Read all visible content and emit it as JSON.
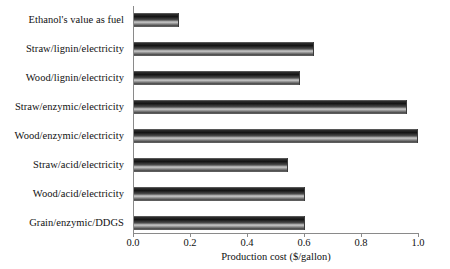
{
  "chart_data": {
    "type": "bar",
    "orientation": "horizontal",
    "title": "",
    "xlabel": "Production cost ($/gallon)",
    "ylabel": "",
    "xlim": [
      0.0,
      1.0
    ],
    "xticks": [
      "0.0",
      "0.2",
      "0.4",
      "0.6",
      "0.8",
      "1.0"
    ],
    "xtick_values": [
      0.0,
      0.2,
      0.4,
      0.6,
      0.8,
      1.0
    ],
    "grid": false,
    "legend": null,
    "categories": [
      "Ethanol's value as fuel",
      "Straw/lignin/electricity",
      "Wood/lignin/electricity",
      "Straw/enzymic/electricity",
      "Wood/enzymic/electricity",
      "Straw/acid/electricity",
      "Wood/acid/electricity",
      "Grain/enzymic/DDGS"
    ],
    "values": [
      0.16,
      0.635,
      0.585,
      0.96,
      1.0,
      0.545,
      0.605,
      0.605
    ],
    "bar_color": "#2b2b2b"
  }
}
